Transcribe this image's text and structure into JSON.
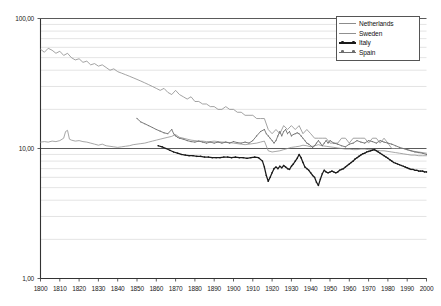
{
  "chart_data": {
    "type": "line",
    "title": "",
    "xlabel": "",
    "ylabel": "",
    "yscale": "log",
    "ylim": [
      1,
      100
    ],
    "xlim": [
      1800,
      2000
    ],
    "grid": true,
    "legend_position": "top-right",
    "y_tick_labels": [
      "100,00",
      "10,00",
      "1,00"
    ],
    "y_tick_values": [
      100,
      10,
      1
    ],
    "y_minor_values": [
      90,
      80,
      70,
      60,
      50,
      40,
      30,
      20,
      9,
      8,
      7,
      6,
      5,
      4,
      3,
      2
    ],
    "x_tick_labels": [
      "1800",
      "1810",
      "1820",
      "1830",
      "1840",
      "1850",
      "1860",
      "1870",
      "1880",
      "1890",
      "1900",
      "1910",
      "1920",
      "1930",
      "1940",
      "1950",
      "1960",
      "1970",
      "1980",
      "1990",
      "2000"
    ],
    "x_tick_values": [
      1800,
      1810,
      1820,
      1830,
      1840,
      1850,
      1860,
      1870,
      1880,
      1890,
      1900,
      1910,
      1920,
      1930,
      1940,
      1950,
      1960,
      1970,
      1980,
      1990,
      2000
    ],
    "series": [
      {
        "name": "Netherlands",
        "color": "#8c8c8c",
        "width": 0.8,
        "markers": false,
        "x": [
          1800,
          1802,
          1804,
          1806,
          1808,
          1810,
          1812,
          1814,
          1816,
          1818,
          1820,
          1822,
          1824,
          1826,
          1828,
          1830,
          1832,
          1834,
          1836,
          1838,
          1840,
          1842,
          1844,
          1846,
          1848,
          1850,
          1852,
          1854,
          1856,
          1858,
          1860,
          1862,
          1864,
          1866,
          1868,
          1870,
          1872,
          1874,
          1876,
          1878,
          1880,
          1882,
          1884,
          1886,
          1888,
          1890,
          1892,
          1894,
          1896,
          1898,
          1900,
          1902,
          1904,
          1906,
          1908,
          1910,
          1912,
          1914,
          1916,
          1918,
          1920,
          1922,
          1924,
          1926,
          1928,
          1930,
          1932,
          1934,
          1936,
          1938,
          1940,
          1942,
          1944,
          1946,
          1948,
          1950,
          1952,
          1954,
          1956,
          1958,
          1960,
          1962,
          1964,
          1966,
          1968,
          1970,
          1972,
          1974,
          1976,
          1978,
          1980,
          1982,
          1984,
          1986,
          1988,
          1990,
          1992,
          1994,
          1996,
          1998,
          2000
        ],
        "values": [
          58,
          55,
          59,
          57,
          54,
          56,
          52,
          54,
          50,
          48,
          49,
          46,
          47,
          44,
          45,
          43,
          44,
          42,
          40,
          41,
          39,
          38,
          37,
          36,
          35,
          34,
          33,
          32,
          31,
          30,
          29,
          28,
          29,
          27,
          26,
          28,
          26,
          25,
          24,
          25,
          23,
          23,
          22,
          22,
          21,
          21,
          20,
          20,
          21,
          20,
          20,
          19,
          19,
          18,
          18,
          18,
          17,
          17,
          17,
          14,
          13,
          14,
          13,
          15,
          14,
          15,
          14,
          15,
          13,
          14,
          13,
          12,
          12,
          12,
          12,
          11,
          11,
          11,
          12,
          12,
          11,
          12,
          12,
          12,
          12,
          11,
          12,
          12,
          11,
          12,
          11,
          10,
          10,
          10,
          10,
          9.8,
          9.6,
          9.5,
          9.4,
          9.3,
          9.2
        ]
      },
      {
        "name": "Sweden",
        "color": "#909090",
        "width": 0.8,
        "markers": false,
        "x": [
          1800,
          1802,
          1804,
          1806,
          1808,
          1810,
          1812,
          1813,
          1814,
          1815,
          1816,
          1818,
          1820,
          1822,
          1824,
          1826,
          1828,
          1830,
          1832,
          1834,
          1836,
          1838,
          1840,
          1842,
          1844,
          1846,
          1848,
          1850,
          1852,
          1854,
          1856,
          1858,
          1860,
          1862,
          1864,
          1866,
          1868,
          1870,
          1872,
          1874,
          1876,
          1878,
          1880,
          1882,
          1884,
          1886,
          1888,
          1890,
          1892,
          1894,
          1896,
          1898,
          1900,
          1902,
          1904,
          1906,
          1908,
          1910,
          1912,
          1914,
          1916,
          1918,
          1920,
          1922,
          1924,
          1926,
          1928,
          1930,
          1932,
          1934,
          1936,
          1938,
          1940,
          1942,
          1944,
          1946,
          1948,
          1950,
          1952,
          1954,
          1956,
          1958,
          1960,
          1962,
          1964,
          1966,
          1968,
          1970,
          1972,
          1974,
          1976,
          1978,
          1980,
          1982,
          1984,
          1986,
          1988,
          1990,
          1992,
          1994,
          1996,
          1998,
          2000
        ],
        "values": [
          11.2,
          11.3,
          11.2,
          11.4,
          11.3,
          11.5,
          12.0,
          13.5,
          13.8,
          11.8,
          11.6,
          11.4,
          11.5,
          11.3,
          11.2,
          11.0,
          10.8,
          10.6,
          10.8,
          10.5,
          10.4,
          10.3,
          10.2,
          10.3,
          10.4,
          10.5,
          10.7,
          10.8,
          10.9,
          11.0,
          11.2,
          11.4,
          11.6,
          11.8,
          12.0,
          12.2,
          12.4,
          12.8,
          12.2,
          12.0,
          11.8,
          11.6,
          11.5,
          11.4,
          11.4,
          11.3,
          11.3,
          11.4,
          11.3,
          11.2,
          11.2,
          11.1,
          11.0,
          10.9,
          10.8,
          10.7,
          10.8,
          10.9,
          11.0,
          11.2,
          11.4,
          9.6,
          9.4,
          9.5,
          9.6,
          9.8,
          10.0,
          10.2,
          10.3,
          10.4,
          10.6,
          10.5,
          10.3,
          10.5,
          10.7,
          10.5,
          10.4,
          10.3,
          10.2,
          10.1,
          10.0,
          9.9,
          9.9,
          9.8,
          9.8,
          9.9,
          9.9,
          9.8,
          9.8,
          9.7,
          9.6,
          9.6,
          9.5,
          9.4,
          9.3,
          9.2,
          9.1,
          9.0,
          8.9,
          8.9,
          8.8,
          8.8,
          8.8
        ]
      },
      {
        "name": "Italy",
        "color": "#1a1a1a",
        "width": 1.25,
        "markers": true,
        "x": [
          1861,
          1863,
          1865,
          1867,
          1869,
          1871,
          1873,
          1875,
          1877,
          1879,
          1881,
          1883,
          1885,
          1887,
          1889,
          1891,
          1893,
          1895,
          1897,
          1899,
          1901,
          1903,
          1905,
          1907,
          1909,
          1911,
          1913,
          1915,
          1916,
          1917,
          1918,
          1919,
          1920,
          1921,
          1922,
          1923,
          1924,
          1925,
          1926,
          1927,
          1928,
          1929,
          1930,
          1931,
          1932,
          1933,
          1934,
          1935,
          1936,
          1937,
          1938,
          1939,
          1940,
          1941,
          1942,
          1943,
          1944,
          1945,
          1946,
          1947,
          1948,
          1949,
          1950,
          1951,
          1952,
          1953,
          1954,
          1955,
          1956,
          1957,
          1958,
          1959,
          1960,
          1961,
          1962,
          1963,
          1964,
          1965,
          1966,
          1967,
          1968,
          1969,
          1970,
          1971,
          1972,
          1973,
          1974,
          1975,
          1976,
          1977,
          1978,
          1979,
          1980,
          1981,
          1982,
          1983,
          1984,
          1985,
          1986,
          1987,
          1988,
          1989,
          1990,
          1991,
          1992,
          1993,
          1994,
          1995,
          1996,
          1997,
          1998,
          1999,
          2000
        ],
        "values": [
          10.5,
          10.3,
          10.0,
          9.7,
          9.4,
          9.2,
          9.0,
          8.9,
          8.8,
          8.8,
          8.7,
          8.7,
          8.6,
          8.6,
          8.5,
          8.5,
          8.5,
          8.6,
          8.6,
          8.5,
          8.6,
          8.5,
          8.5,
          8.4,
          8.5,
          8.6,
          8.5,
          8.0,
          7.2,
          6.2,
          5.6,
          6.0,
          6.5,
          7.0,
          7.2,
          7.0,
          7.3,
          7.1,
          7.4,
          7.2,
          7.0,
          6.9,
          7.3,
          7.6,
          8.0,
          8.4,
          9.0,
          8.5,
          7.8,
          7.2,
          7.0,
          6.8,
          6.5,
          6.2,
          6.0,
          5.5,
          5.2,
          5.8,
          6.4,
          6.8,
          6.6,
          6.5,
          6.6,
          6.7,
          6.6,
          6.5,
          6.6,
          6.8,
          6.9,
          7.0,
          7.2,
          7.4,
          7.6,
          7.8,
          8.0,
          8.3,
          8.5,
          8.7,
          8.9,
          9.1,
          9.2,
          9.4,
          9.5,
          9.6,
          9.7,
          9.8,
          9.6,
          9.4,
          9.2,
          9.0,
          8.8,
          8.6,
          8.4,
          8.2,
          8.0,
          7.8,
          7.7,
          7.6,
          7.5,
          7.4,
          7.3,
          7.2,
          7.1,
          7.0,
          6.9,
          6.9,
          6.8,
          6.8,
          6.7,
          6.7,
          6.7,
          6.6,
          6.6
        ]
      },
      {
        "name": "Spain",
        "color": "#6e6e6e",
        "width": 0.9,
        "markers": true,
        "x": [
          1850,
          1852,
          1854,
          1856,
          1858,
          1860,
          1862,
          1864,
          1866,
          1868,
          1869,
          1870,
          1871,
          1872,
          1874,
          1876,
          1878,
          1880,
          1882,
          1884,
          1886,
          1888,
          1890,
          1892,
          1894,
          1896,
          1898,
          1900,
          1902,
          1904,
          1906,
          1908,
          1910,
          1912,
          1914,
          1916,
          1917,
          1918,
          1919,
          1920,
          1921,
          1922,
          1923,
          1924,
          1925,
          1926,
          1927,
          1928,
          1929,
          1930,
          1931,
          1932,
          1933,
          1934,
          1935,
          1936,
          1937,
          1938,
          1939,
          1940,
          1941,
          1942,
          1943,
          1944,
          1945,
          1946,
          1947,
          1948,
          1949,
          1950,
          1952,
          1954,
          1956,
          1958,
          1960,
          1962,
          1964,
          1966,
          1968,
          1970,
          1972,
          1974,
          1976,
          1978,
          1980,
          1982,
          1984,
          1986,
          1988,
          1990,
          1992,
          1994,
          1996,
          1998,
          2000
        ],
        "values": [
          17.0,
          16.0,
          15.5,
          15.0,
          14.5,
          14.0,
          13.6,
          13.2,
          13.0,
          14.0,
          13.0,
          12.5,
          12.2,
          12.0,
          11.8,
          11.5,
          11.3,
          11.2,
          11.4,
          11.2,
          11.0,
          11.2,
          11.0,
          11.2,
          11.0,
          11.2,
          11.0,
          11.3,
          11.1,
          11.0,
          11.2,
          11.0,
          11.5,
          12.5,
          13.5,
          14.0,
          13.0,
          12.5,
          12.0,
          11.5,
          11.0,
          11.5,
          12.5,
          13.5,
          12.5,
          13.5,
          14.0,
          13.0,
          13.5,
          12.5,
          12.8,
          13.0,
          13.2,
          13.0,
          12.5,
          12.0,
          11.5,
          11.0,
          10.8,
          10.5,
          10.2,
          10.5,
          11.0,
          11.5,
          11.0,
          10.5,
          11.0,
          11.5,
          11.0,
          11.5,
          11.0,
          10.8,
          10.5,
          10.3,
          10.8,
          11.0,
          11.5,
          11.2,
          11.0,
          11.5,
          11.3,
          11.0,
          11.5,
          11.2,
          11.0,
          10.8,
          10.5,
          10.2,
          10.0,
          9.8,
          9.6,
          9.4,
          9.3,
          9.2,
          9.0
        ]
      }
    ]
  },
  "legend": {
    "items": [
      {
        "label": "Netherlands"
      },
      {
        "label": "Sweden"
      },
      {
        "label": "Italy"
      },
      {
        "label": "Spain"
      }
    ]
  }
}
